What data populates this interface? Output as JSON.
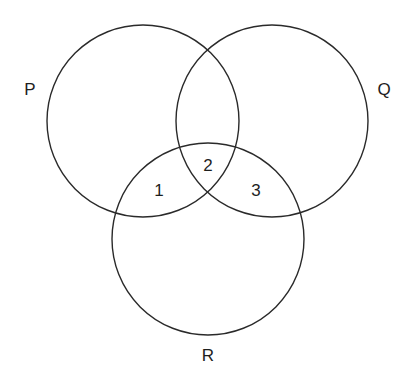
{
  "diagram": {
    "type": "venn",
    "sets": [
      {
        "id": "P",
        "label": "P"
      },
      {
        "id": "Q",
        "label": "Q"
      },
      {
        "id": "R",
        "label": "R"
      }
    ],
    "regions": [
      {
        "label": "1",
        "sets": [
          "P",
          "R"
        ],
        "description": "P and R only"
      },
      {
        "label": "2",
        "sets": [
          "P",
          "Q",
          "R"
        ],
        "description": "P, Q and R"
      },
      {
        "label": "3",
        "sets": [
          "Q",
          "R"
        ],
        "description": "Q and R only"
      }
    ]
  },
  "colors": {
    "stroke": "#2a2a2a",
    "text": "#1e1e1e",
    "background": "#ffffff"
  }
}
